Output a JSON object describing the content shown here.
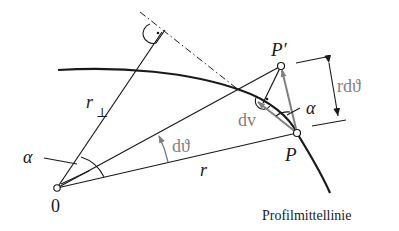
{
  "labels": {
    "origin": "0",
    "r_perp": "r",
    "r_perp_sub": "⊥",
    "alpha_origin": "α",
    "dtheta": "dϑ",
    "r": "r",
    "P": "P",
    "P_prime": "P′",
    "dv": "dv",
    "alpha_P": "α",
    "r_dtheta": "rdϑ",
    "profile_line": "Profilmittellinie"
  },
  "colors": {
    "line": "#1a1a1a",
    "gray_accent": "#808080",
    "background": "#ffffff"
  },
  "points": {
    "O": [
      57,
      188
    ],
    "P": [
      297,
      133
    ],
    "P_prime": [
      281,
      66
    ],
    "perp_foot": [
      157,
      34
    ]
  }
}
